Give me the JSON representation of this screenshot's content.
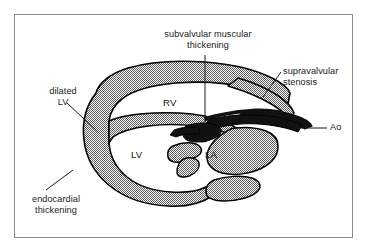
{
  "figure": {
    "frame_color": "#8a8a8a",
    "background_color": "#ffffff",
    "myocardium_fill": "#9d9d9d",
    "thickening_fill": "#1a1a1a",
    "outline_color": "#000000"
  },
  "annotations": {
    "subvalvular": {
      "line1": "subvalvular muscular",
      "line2": "thickening",
      "leader": "vertical"
    },
    "supravalvular": {
      "line1": "supravalvular",
      "line2": "stenosis",
      "leader": "diagonal"
    },
    "dilated": {
      "line1": "dilated",
      "line2": "LV",
      "leader": "diagonal"
    },
    "endocardial": {
      "line1": "endocardial",
      "line2": "thickening",
      "leader": "diagonal"
    },
    "aorta": {
      "label": "Ao",
      "leader": "horizontal"
    }
  },
  "chambers": {
    "rv": "RV",
    "lv": "LV",
    "la": "LA"
  }
}
